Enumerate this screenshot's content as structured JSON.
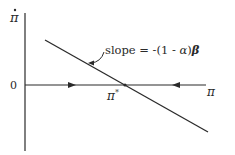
{
  "diagram": {
    "type": "phase-diagram",
    "y_axis_label": "π̇",
    "x_axis_label": "π",
    "origin_label": "0",
    "equilibrium_label": "π",
    "equilibrium_superscript": "*",
    "slope_annotation": {
      "prefix": "slope = -(1 - ",
      "alpha": "α",
      "close": ")",
      "beta": "β"
    },
    "line_description": "downward-sloping line crossing horizontal axis at π*",
    "arrows": [
      {
        "position": "left of π*",
        "direction": "right"
      },
      {
        "position": "right of π*",
        "direction": "left"
      }
    ],
    "colors": {
      "ink": "#2a2a2a",
      "background": "#ffffff"
    }
  }
}
